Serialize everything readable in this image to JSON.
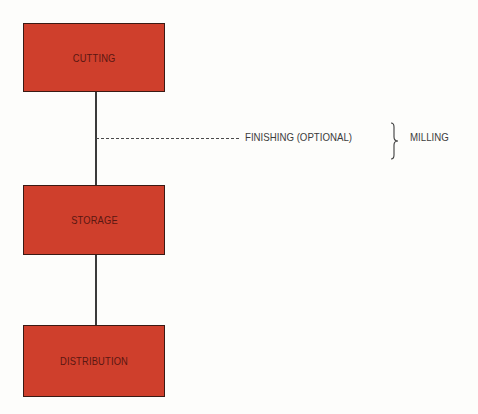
{
  "diagram": {
    "nodes": [
      {
        "id": "cutting",
        "label": "CUTTING"
      },
      {
        "id": "storage",
        "label": "STORAGE"
      },
      {
        "id": "distribution",
        "label": "DISTRIBUTION"
      }
    ],
    "branch": {
      "label": "FINISHING (OPTIONAL)",
      "group_label": "MILLING"
    },
    "colors": {
      "node_fill": "#cf3f2c",
      "node_text": "#5a1712",
      "line": "#3a3a3a"
    }
  }
}
